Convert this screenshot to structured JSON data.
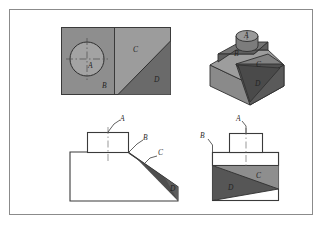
{
  "figure": {
    "border_color": "#8b8b8b",
    "background": "#ffffff"
  },
  "palette": {
    "surface_light": "#a9a9a9",
    "surface_medium": "#8f8f8f",
    "surface_dark": "#636363",
    "surface_darkest": "#4a4a4a",
    "outline": "#3a3a3a",
    "thin_line": "#6e6e6e",
    "white": "#ffffff"
  },
  "views": {
    "top_view": {
      "name": "Top view",
      "labels": [
        {
          "text": "A",
          "id": "top-label-a"
        },
        {
          "text": "B",
          "id": "top-label-b"
        },
        {
          "text": "C",
          "id": "top-label-c"
        },
        {
          "text": "D",
          "id": "top-label-d"
        }
      ]
    },
    "pictorial_view": {
      "name": "Isometric pictorial view",
      "labels": [
        {
          "text": "A",
          "id": "iso-label-a"
        },
        {
          "text": "B",
          "id": "iso-label-b"
        },
        {
          "text": "C",
          "id": "iso-label-c"
        },
        {
          "text": "D",
          "id": "iso-label-d"
        }
      ]
    },
    "front_view": {
      "name": "Front view",
      "labels": [
        {
          "text": "A",
          "id": "front-label-a"
        },
        {
          "text": "B",
          "id": "front-label-b"
        },
        {
          "text": "C",
          "id": "front-label-c"
        },
        {
          "text": "D",
          "id": "front-label-d"
        }
      ]
    },
    "side_view": {
      "name": "Right side view",
      "labels": [
        {
          "text": "A",
          "id": "side-label-a"
        },
        {
          "text": "B",
          "id": "side-label-b"
        },
        {
          "text": "C",
          "id": "side-label-c"
        },
        {
          "text": "D",
          "id": "side-label-d"
        }
      ]
    }
  }
}
